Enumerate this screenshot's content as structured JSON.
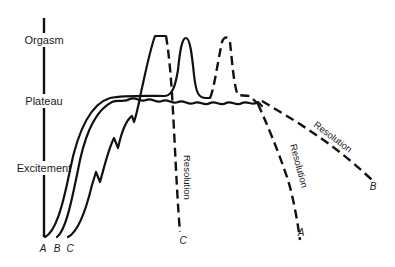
{
  "diagram": {
    "title": "",
    "axis": {
      "levels": [
        {
          "label": "Orgasm"
        },
        {
          "label": "Plateau"
        },
        {
          "label": "Excitement"
        }
      ]
    },
    "curves": [
      {
        "id": "A",
        "label": "A",
        "resolution_label": "Resolution",
        "description": "Rises through excitement and plateau, then oscillating multiple orgasm peaks, gradual dashed resolution"
      },
      {
        "id": "B",
        "label": "B",
        "resolution_label": "Resolution",
        "description": "Rises to a wavy prolonged plateau with no orgasm, very slow dashed resolution"
      },
      {
        "id": "C",
        "label": "C",
        "resolution_label": "Resolution",
        "description": "Jagged excitement, steep rise to a sustained orgasm plateau, rapid dashed resolution"
      }
    ],
    "colors": {
      "line": "#111111",
      "background": "#ffffff"
    }
  }
}
